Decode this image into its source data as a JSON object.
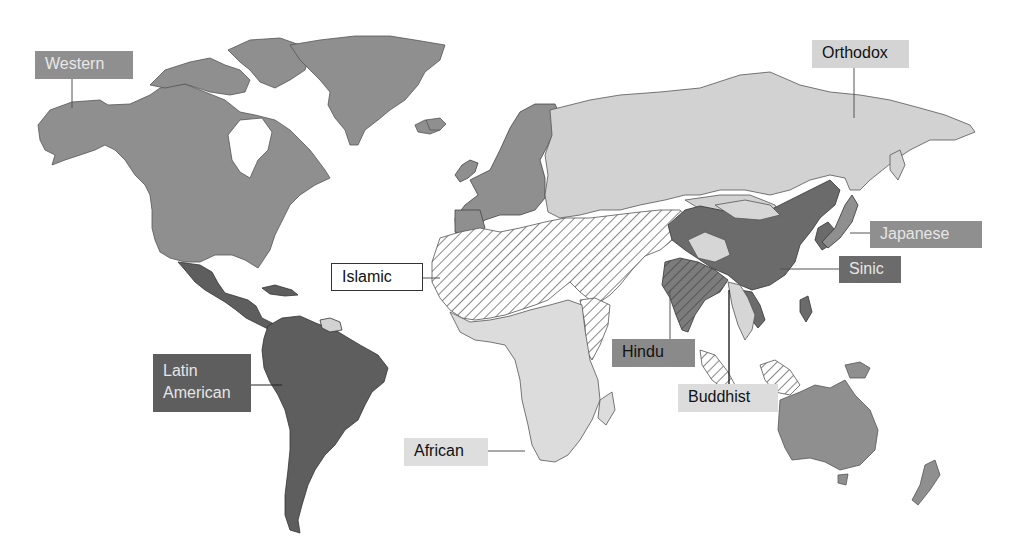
{
  "map": {
    "type": "world civilizations map",
    "colors": {
      "western": "#8f8f8f",
      "orthodox": "#d2d2d2",
      "latin_american": "#5e5e5e",
      "sinic": "#6b6b6b",
      "japanese": "#8f8f8f",
      "hindu": "#7c7c7c",
      "buddhist": "#d6d6d6",
      "african": "#dcdcdc",
      "islamic": "hatched",
      "border": "#444444"
    },
    "labels": [
      {
        "id": "western",
        "text": "Western"
      },
      {
        "id": "orthodox",
        "text": "Orthodox"
      },
      {
        "id": "japanese",
        "text": "Japanese"
      },
      {
        "id": "sinic",
        "text": "Sinic"
      },
      {
        "id": "islamic",
        "text": "Islamic"
      },
      {
        "id": "hindu",
        "text": "Hindu"
      },
      {
        "id": "buddhist",
        "text": "Buddhist"
      },
      {
        "id": "african",
        "text": "African"
      },
      {
        "id": "latin_american",
        "text": "Latin American"
      }
    ]
  }
}
